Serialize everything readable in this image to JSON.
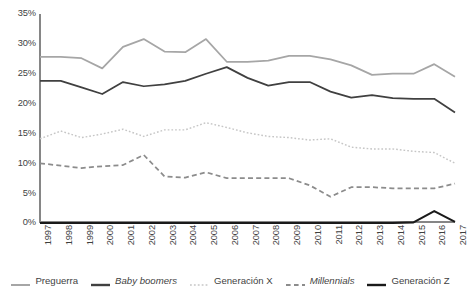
{
  "chart_data": {
    "type": "line",
    "title": "",
    "xlabel": "",
    "ylabel": "",
    "grid": false,
    "legend_position": "bottom",
    "xlim": [
      1997,
      2017
    ],
    "ylim": [
      0,
      35
    ],
    "y_ticks": [
      "0%",
      "5%",
      "10%",
      "15%",
      "20%",
      "25%",
      "30%",
      "35%"
    ],
    "y_tick_values": [
      0,
      5,
      10,
      15,
      20,
      25,
      30,
      35
    ],
    "categories": [
      "1997",
      "1998",
      "1999",
      "2000",
      "2001",
      "2002",
      "2003",
      "2004",
      "2005",
      "2006",
      "2007",
      "2008",
      "2009",
      "2010",
      "2011",
      "2012",
      "2013",
      "2014",
      "2015",
      "2016",
      "2017"
    ],
    "series": [
      {
        "name": "Preguerra",
        "color": "#a6a6a6",
        "style": "solid",
        "italic": false,
        "values": [
          27.8,
          27.8,
          27.6,
          25.9,
          29.5,
          30.8,
          28.7,
          28.6,
          30.8,
          27.0,
          27.0,
          27.2,
          28.0,
          28.0,
          27.4,
          26.4,
          24.8,
          25.0,
          25.0,
          26.6,
          24.5
        ]
      },
      {
        "name": "Baby boomers",
        "color": "#404040",
        "style": "solid",
        "italic": true,
        "values": [
          23.8,
          23.8,
          22.7,
          21.6,
          23.6,
          22.9,
          23.2,
          23.8,
          25.0,
          26.1,
          24.3,
          23.0,
          23.6,
          23.6,
          22.0,
          21.0,
          21.4,
          20.9,
          20.8,
          20.8,
          18.5
        ]
      },
      {
        "name": "Generación X",
        "color": "#c6c6c6",
        "style": "dotted",
        "italic": false,
        "values": [
          14.1,
          15.4,
          14.3,
          14.9,
          15.7,
          14.5,
          15.6,
          15.6,
          16.8,
          16.0,
          15.1,
          14.5,
          14.3,
          13.9,
          14.1,
          12.7,
          12.4,
          12.4,
          12.0,
          11.8,
          10.0
        ]
      },
      {
        "name": "Millennials",
        "color": "#8c8c8c",
        "style": "dashed",
        "italic": true,
        "values": [
          10.0,
          9.6,
          9.2,
          9.5,
          9.7,
          11.4,
          7.8,
          7.6,
          8.5,
          7.5,
          7.5,
          7.5,
          7.5,
          6.3,
          4.4,
          6.0,
          6.0,
          5.8,
          5.8,
          5.8,
          6.6
        ]
      },
      {
        "name": "Generación Z",
        "color": "#1a1a1a",
        "style": "solid",
        "italic": false,
        "values": [
          0,
          0,
          0,
          0,
          0,
          0,
          0,
          0,
          0,
          0,
          0,
          0,
          0,
          0,
          0,
          0,
          0,
          0,
          0.1,
          2.0,
          0.2
        ]
      }
    ]
  }
}
